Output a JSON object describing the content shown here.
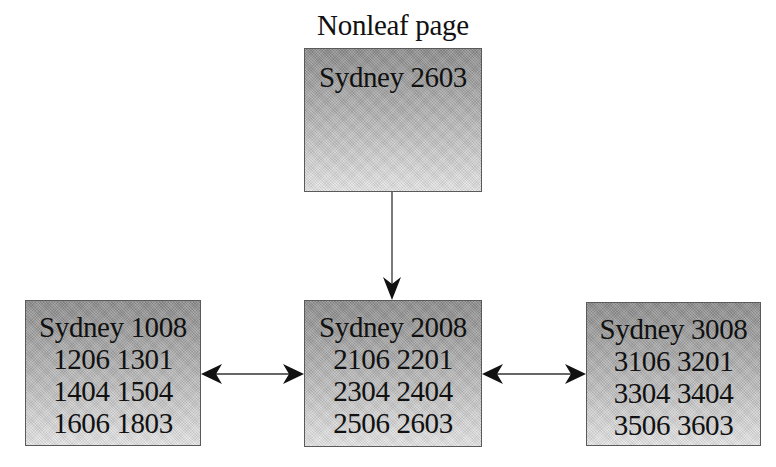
{
  "diagram": {
    "title": "Nonleaf page",
    "colors": {
      "box_gradient_top": "#8e8e8e",
      "box_gradient_bottom": "#e6e6e6",
      "box_border": "#5a5a5a",
      "arrow": "#111111",
      "text": "#111111"
    },
    "nodes": {
      "root": {
        "lines": [
          "Sydney 2603"
        ]
      },
      "leaf_left": {
        "lines": [
          "Sydney 1008",
          "1206 1301",
          "1404 1504",
          "1606 1803"
        ]
      },
      "leaf_middle": {
        "lines": [
          "Sydney 2008",
          "2106 2201",
          "2304 2404",
          "2506 2603"
        ]
      },
      "leaf_right": {
        "lines": [
          "Sydney 3008",
          "3106 3201",
          "3304 3404",
          "3506 3603"
        ]
      }
    },
    "edges": [
      {
        "from": "root",
        "to": "leaf_middle",
        "type": "directed"
      },
      {
        "from": "leaf_left",
        "to": "leaf_middle",
        "type": "bidirectional"
      },
      {
        "from": "leaf_middle",
        "to": "leaf_right",
        "type": "bidirectional"
      }
    ]
  }
}
